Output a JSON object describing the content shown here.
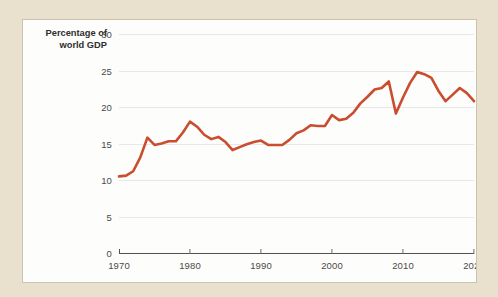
{
  "page": {
    "background_color": "#e9e1cd",
    "panel_color": "#fdfdfc",
    "panel_border_color": "#c9c3b2"
  },
  "axis_title": {
    "line1": "Percentage of",
    "line2": "world GDP"
  },
  "chart_data": {
    "type": "line",
    "title": "",
    "subtitle": "",
    "xlabel": "",
    "ylabel": "Percentage of world GDP",
    "xlim": [
      1970,
      2020
    ],
    "ylim": [
      0,
      30
    ],
    "xticks": [
      1970,
      1980,
      1990,
      2000,
      2010,
      2020
    ],
    "yticks": [
      0,
      5,
      10,
      15,
      20,
      25,
      30
    ],
    "grid": "horizontal",
    "legend": "none",
    "line_color": "#c94d2e",
    "line_width": 2.6,
    "x": [
      1970,
      1971,
      1972,
      1973,
      1974,
      1975,
      1976,
      1977,
      1978,
      1979,
      1980,
      1981,
      1982,
      1983,
      1984,
      1985,
      1986,
      1987,
      1988,
      1989,
      1990,
      1991,
      1992,
      1993,
      1994,
      1995,
      1996,
      1997,
      1998,
      1999,
      2000,
      2001,
      2002,
      2003,
      2004,
      2005,
      2006,
      2007,
      2008,
      2009,
      2010,
      2011,
      2012,
      2013,
      2014,
      2015,
      2016,
      2017,
      2018,
      2019,
      2020
    ],
    "values": [
      10.5,
      10.6,
      11.2,
      13.1,
      15.8,
      14.8,
      15.0,
      15.3,
      15.3,
      16.5,
      18.0,
      17.3,
      16.2,
      15.6,
      15.9,
      15.2,
      14.1,
      14.5,
      14.9,
      15.2,
      15.4,
      14.8,
      14.8,
      14.8,
      15.5,
      16.4,
      16.8,
      17.5,
      17.4,
      17.4,
      18.9,
      18.2,
      18.4,
      19.2,
      20.5,
      21.4,
      22.4,
      22.6,
      23.5,
      19.1,
      21.3,
      23.3,
      24.8,
      24.5,
      24.0,
      22.2,
      20.8,
      21.7,
      22.6,
      21.9,
      20.8
    ],
    "series": [
      {
        "name": "Percentage of world GDP",
        "color": "#c94d2e",
        "values": [
          10.5,
          10.6,
          11.2,
          13.1,
          15.8,
          14.8,
          15.0,
          15.3,
          15.3,
          16.5,
          18.0,
          17.3,
          16.2,
          15.6,
          15.9,
          15.2,
          14.1,
          14.5,
          14.9,
          15.2,
          15.4,
          14.8,
          14.8,
          14.8,
          15.5,
          16.4,
          16.8,
          17.5,
          17.4,
          17.4,
          18.9,
          18.2,
          18.4,
          19.2,
          20.5,
          21.4,
          22.4,
          22.6,
          23.5,
          19.1,
          21.3,
          23.3,
          24.8,
          24.5,
          24.0,
          22.2,
          20.8,
          21.7,
          22.6,
          21.9,
          20.8
        ]
      }
    ],
    "annotations": []
  }
}
